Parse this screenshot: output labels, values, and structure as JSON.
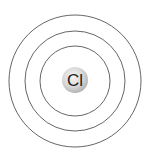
{
  "diagram": {
    "type": "bohr-atom-model",
    "element_symbol": "Cl",
    "shell_count": 3,
    "center": {
      "x": 75,
      "y": 81
    },
    "shell_radii": [
      35,
      50,
      66
    ],
    "nucleus_radius": 13,
    "colors": {
      "shell_stroke": "#555555",
      "nucleus_light": "#f4f4f4",
      "nucleus_dark": "#b8b8b8",
      "label": "#222222",
      "background": "#ffffff"
    }
  }
}
